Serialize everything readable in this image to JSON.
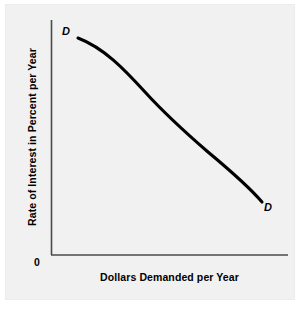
{
  "figure": {
    "background_color": "#f1f1f1",
    "page_color": "#ffffff",
    "axis_color": "#404040",
    "curve_color": "#000000"
  },
  "axes": {
    "origin_label": "0",
    "x_title": "Dollars Demanded per Year",
    "y_title": "Rate of Interest in Percent per Year"
  },
  "curve": {
    "start_label": "D",
    "end_label": "D",
    "path": "M 78,38 C 104,48 124,69 145,92 C 166,115 186,133 208,152 C 232,172 250,188 262,202"
  },
  "chart_data": {
    "type": "line",
    "title": "",
    "xlabel": "Dollars Demanded per Year",
    "ylabel": "Rate of Interest in Percent per Year",
    "grid": false,
    "legend": "none",
    "xlim": [
      0,
      100
    ],
    "ylim": [
      0,
      100
    ],
    "x_ticks": [],
    "y_ticks": [],
    "annotations": [
      {
        "text": "D",
        "x": 11,
        "y": 92,
        "style": "bold-italic",
        "position": "curve-upper-left-endpoint"
      },
      {
        "text": "D",
        "x": 91,
        "y": 22,
        "style": "bold-italic",
        "position": "curve-lower-right-endpoint"
      },
      {
        "text": "0",
        "x": 0,
        "y": 0,
        "style": "bold",
        "position": "origin"
      }
    ],
    "series": [
      {
        "name": "D",
        "description": "Demand curve for loanable funds, downward sloping",
        "x": [
          11,
          20,
          30,
          40,
          50,
          60,
          70,
          80,
          89
        ],
        "y": [
          92,
          85,
          76,
          67,
          58,
          50,
          42,
          32,
          22
        ]
      }
    ]
  }
}
